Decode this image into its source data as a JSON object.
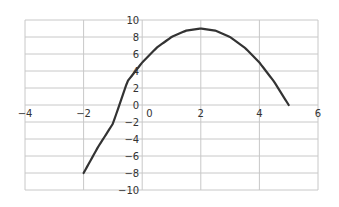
{
  "chart_data": {
    "type": "line",
    "title": "",
    "xlabel": "",
    "ylabel": "",
    "xlim": [
      -4,
      6
    ],
    "ylim": [
      -10,
      10
    ],
    "x_ticks": [
      -4,
      -2,
      0,
      2,
      4,
      6
    ],
    "y_ticks": [
      10,
      8,
      6,
      4,
      2,
      0,
      -2,
      -4,
      -6,
      -8,
      -10
    ],
    "grid": true,
    "legend": null,
    "series": [
      {
        "name": "y = -x^2 + 4x + 5",
        "color": "#333333",
        "x": [
          -2,
          -1.5,
          -1,
          -0.5,
          0,
          0.5,
          1,
          1.5,
          2,
          2.5,
          3,
          3.5,
          4,
          4.5,
          5
        ],
        "y": [
          -8,
          -4.9,
          -2.2,
          2.8,
          5,
          6.75,
          8,
          8.75,
          9,
          8.75,
          8,
          6.75,
          5,
          2.75,
          0
        ]
      }
    ]
  },
  "colors": {
    "grid": "#c8c8c8",
    "line": "#333333",
    "axis_text": "#333333"
  }
}
